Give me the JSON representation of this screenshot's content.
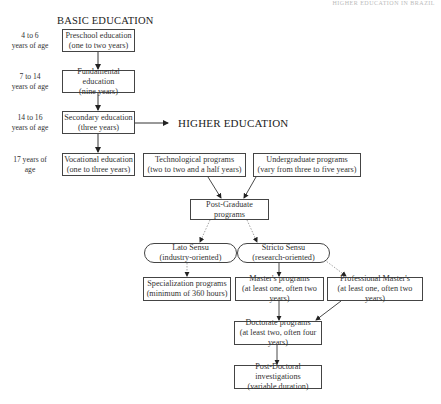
{
  "running_header": "HIGHER EDUCATION IN BRAZIL",
  "sections": {
    "basic": "BASIC EDUCATION",
    "higher": "HIGHER EDUCATION"
  },
  "ages": [
    {
      "line1": "4 to 6",
      "line2": "years of age"
    },
    {
      "line1": "7 to 14",
      "line2": "years of age"
    },
    {
      "line1": "14 to 16",
      "line2": "years of age"
    },
    {
      "line1": "17 years of",
      "line2": "age"
    }
  ],
  "nodes": {
    "preschool": {
      "title": "Preschool education",
      "sub": "(one to two years)"
    },
    "fundamental": {
      "title": "Fundamental education",
      "sub": "(nine years)"
    },
    "secondary": {
      "title": "Secondary education",
      "sub": "(three years)"
    },
    "vocational": {
      "title": "Vocational education",
      "sub": "(one to three years)"
    },
    "technological": {
      "title": "Technological programs",
      "sub": "(two to two and a half years)"
    },
    "undergraduate": {
      "title": "Undergraduate programs",
      "sub": "(vary from three to five years)"
    },
    "postgraduate": {
      "title": "Post-Graduate programs"
    },
    "lato": {
      "title": "Lato Sensu",
      "sub": "(industry-oriented)"
    },
    "stricto": {
      "title": "Stricto Sensu",
      "sub": "(research-oriented)"
    },
    "specialization": {
      "title": "Specialization programs",
      "sub": "(minimum of 360 hours)"
    },
    "masters": {
      "title": "Master's programs",
      "sub": "(at least one, often two years)"
    },
    "professional": {
      "title": "Professional Master's",
      "sub": "(at least one, often two years)"
    },
    "doctorate": {
      "title": "Doctorate programs",
      "sub": "(at least two, often four years)"
    },
    "postdoc": {
      "title": "Post-Doctoral investigations",
      "sub": "(variable duration)"
    }
  },
  "colors": {
    "line": "#333333",
    "dotted": "#888888",
    "box_border": "#444444"
  }
}
